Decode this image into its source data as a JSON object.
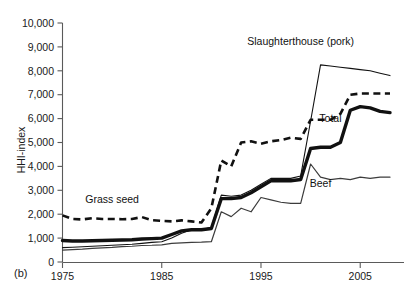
{
  "figure": {
    "panel_label": "(b)",
    "ylabel": "HHI-index",
    "xlabel": ""
  },
  "chart_data": {
    "type": "line",
    "title": "",
    "xlabel": "",
    "ylabel": "HHI-index",
    "xlim": [
      1975,
      2008
    ],
    "ylim": [
      0,
      10000
    ],
    "yticks": [
      0,
      1000,
      2000,
      3000,
      4000,
      5000,
      6000,
      7000,
      8000,
      9000,
      10000
    ],
    "ytick_labels": [
      "0",
      "1,000",
      "2,000",
      "3,000",
      "4,000",
      "5,000",
      "6,000",
      "7,000",
      "8,000",
      "9,000",
      "10,000"
    ],
    "xticks": [
      1975,
      1985,
      1995,
      2005
    ],
    "xtick_labels": [
      "1975",
      "1985",
      "1995",
      "2005"
    ],
    "grid": false,
    "legend_position": "inline-annotations",
    "x": [
      1975,
      1976,
      1977,
      1978,
      1979,
      1980,
      1981,
      1982,
      1983,
      1984,
      1985,
      1986,
      1987,
      1988,
      1989,
      1990,
      1991,
      1992,
      1993,
      1994,
      1995,
      1996,
      1997,
      1998,
      1999,
      2000,
      2001,
      2002,
      2003,
      2004,
      2005,
      2006,
      2007,
      2008
    ],
    "series": [
      {
        "name": "Grass seed",
        "style": "dashed",
        "label_x": 1980,
        "label_y": 2450,
        "values": [
          1950,
          1800,
          1780,
          1830,
          1800,
          1800,
          1790,
          1800,
          1880,
          1750,
          1720,
          1700,
          1740,
          1700,
          1650,
          2250,
          4250,
          4000,
          5000,
          5050,
          4950,
          5050,
          5100,
          5200,
          5150,
          5950,
          5950,
          5950,
          6200,
          7000,
          7050,
          7050,
          7050,
          7050
        ]
      },
      {
        "name": "Total",
        "style": "thick-solid",
        "label_x": 2002,
        "label_y": 5850,
        "values": [
          900,
          880,
          880,
          890,
          900,
          910,
          920,
          930,
          960,
          980,
          1000,
          1150,
          1300,
          1350,
          1350,
          1400,
          2650,
          2650,
          2700,
          2900,
          3150,
          3400,
          3400,
          3400,
          3450,
          4750,
          4800,
          4800,
          5000,
          6350,
          6500,
          6450,
          6300,
          6250
        ]
      },
      {
        "name": "Slaughterthouse (pork)",
        "style": "thin-solid",
        "label_x": 1999,
        "label_y": 9100,
        "values": [
          600,
          620,
          640,
          660,
          680,
          700,
          720,
          740,
          780,
          820,
          850,
          1000,
          1200,
          1350,
          1350,
          1450,
          2800,
          2750,
          2800,
          3000,
          3250,
          3500,
          3500,
          3500,
          3600,
          5900,
          8250,
          8200,
          8150,
          8100,
          8050,
          8000,
          7900,
          7800
        ]
      },
      {
        "name": "Beef",
        "style": "thin-solid-grey",
        "label_x": 2001,
        "label_y": 3150,
        "values": [
          500,
          520,
          540,
          570,
          590,
          610,
          640,
          660,
          690,
          700,
          720,
          780,
          800,
          820,
          830,
          850,
          2100,
          1900,
          2250,
          2100,
          2700,
          2600,
          2500,
          2450,
          2450,
          4100,
          3550,
          3450,
          3500,
          3450,
          3550,
          3500,
          3550,
          3550
        ]
      }
    ]
  }
}
